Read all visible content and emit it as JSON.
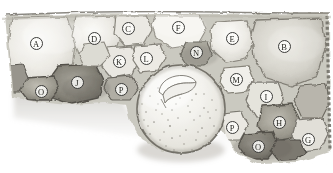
{
  "figure": {
    "background_color": "#ffffff",
    "ink_color": "#3a3a38",
    "tone_light": "#efeeea",
    "tone_mid": "#b8b6ad",
    "tone_dark": "#6d6a60",
    "tone_darkest": "#4a473f"
  },
  "labels": [
    {
      "id": "label-a",
      "text": "A",
      "x": 36,
      "y": 43
    },
    {
      "id": "label-d",
      "text": "D",
      "x": 94,
      "y": 38
    },
    {
      "id": "label-c",
      "text": "C",
      "x": 128,
      "y": 28
    },
    {
      "id": "label-f",
      "text": "F",
      "x": 178,
      "y": 27
    },
    {
      "id": "label-e",
      "text": "E",
      "x": 232,
      "y": 38
    },
    {
      "id": "label-b",
      "text": "B",
      "x": 284,
      "y": 46
    },
    {
      "id": "label-k",
      "text": "K",
      "x": 119,
      "y": 61
    },
    {
      "id": "label-l",
      "text": "L",
      "x": 146,
      "y": 58
    },
    {
      "id": "label-n",
      "text": "N",
      "x": 196,
      "y": 52
    },
    {
      "id": "label-m",
      "text": "M",
      "x": 236,
      "y": 79
    },
    {
      "id": "label-j",
      "text": "J",
      "x": 77,
      "y": 82
    },
    {
      "id": "label-o-left",
      "text": "O",
      "x": 41,
      "y": 91
    },
    {
      "id": "label-p-left",
      "text": "P",
      "x": 121,
      "y": 89
    },
    {
      "id": "label-i",
      "text": "I",
      "x": 266,
      "y": 96
    },
    {
      "id": "label-p-right",
      "text": "P",
      "x": 232,
      "y": 127
    },
    {
      "id": "label-h",
      "text": "H",
      "x": 279,
      "y": 122
    },
    {
      "id": "label-o-right",
      "text": "O",
      "x": 258,
      "y": 146
    },
    {
      "id": "label-g",
      "text": "G",
      "x": 308,
      "y": 139
    }
  ],
  "features": {
    "large_cell": {
      "name": "large-speckled-cell",
      "cx": 181,
      "cy": 109,
      "r": 44
    },
    "inclusion": {
      "name": "crystal-inclusion",
      "cx": 176,
      "cy": 84
    }
  }
}
